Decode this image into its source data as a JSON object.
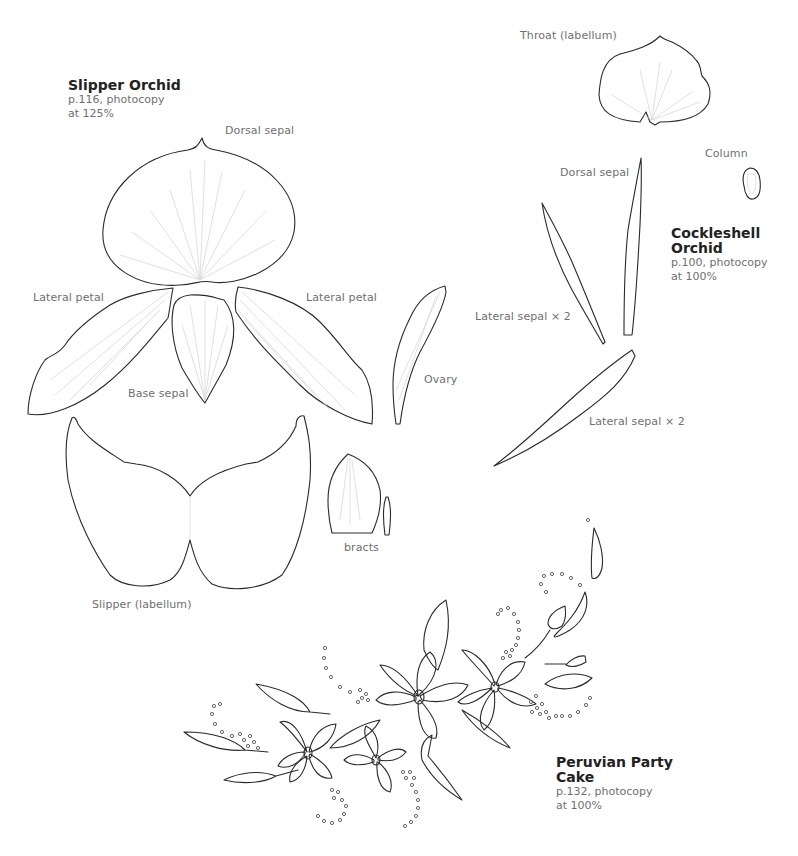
{
  "slipper_orchid": {
    "title": "Slipper Orchid",
    "page_ref": "p.116, photocopy",
    "scale": "at 125%",
    "labels": {
      "dorsal_sepal": "Dorsal sepal",
      "lateral_petal_left": "Lateral petal",
      "lateral_petal_right": "Lateral petal",
      "base_sepal": "Base sepal",
      "slipper": "Slipper (labellum)",
      "ovary": "Ovary",
      "bracts": "bracts"
    }
  },
  "cockleshell_orchid": {
    "title_line1": "Cockleshell",
    "title_line2": "Orchid",
    "page_ref": "p.100, photocopy",
    "scale": "at 100%",
    "labels": {
      "throat": "Throat (labellum)",
      "column": "Column",
      "dorsal_sepal": "Dorsal sepal",
      "lateral_sepal_upper": "Lateral sepal × 2",
      "lateral_sepal_lower": "Lateral sepal × 2"
    }
  },
  "peruvian_party_cake": {
    "title_line1": "Peruvian Party",
    "title_line2": "Cake",
    "page_ref": "p.132, photocopy",
    "scale": "at 100%"
  }
}
